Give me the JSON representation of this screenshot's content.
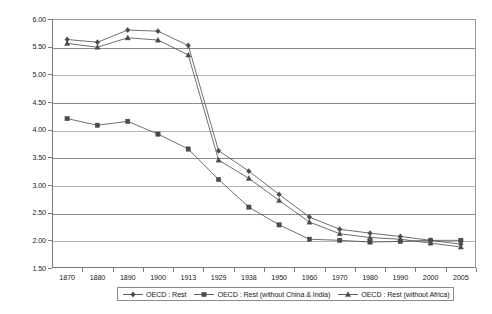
{
  "chart_data": {
    "type": "line",
    "title": "",
    "xlabel": "",
    "ylabel": "",
    "categories": [
      "1870",
      "1880",
      "1890",
      "1900",
      "1913",
      "1929",
      "1938",
      "1950",
      "1960",
      "1970",
      "1980",
      "1990",
      "2000",
      "2005"
    ],
    "ylim": [
      1.5,
      6.0
    ],
    "ytick_step": 0.5,
    "yticks": [
      "1.50",
      "2.00",
      "2.50",
      "3.00",
      "3.50",
      "4.00",
      "4.50",
      "5.00",
      "5.50",
      "6.00"
    ],
    "grid": true,
    "legend_position": "bottom",
    "series": [
      {
        "name": "OECD : Rest",
        "marker": "diamond",
        "color": "#4a4a4a",
        "values": [
          5.63,
          5.58,
          5.8,
          5.78,
          5.52,
          3.62,
          3.25,
          2.83,
          2.42,
          2.2,
          2.13,
          2.07,
          2.0,
          1.93
        ]
      },
      {
        "name": "OECD : Rest (without China & India)",
        "marker": "square",
        "color": "#4a4a4a",
        "values": [
          4.2,
          4.08,
          4.15,
          3.92,
          3.65,
          3.1,
          2.6,
          2.28,
          2.02,
          2.0,
          1.97,
          1.98,
          2.0,
          2.0
        ]
      },
      {
        "name": "OECD : Rest (without Africa)",
        "marker": "triangle",
        "color": "#4a4a4a",
        "values": [
          5.56,
          5.49,
          5.66,
          5.62,
          5.35,
          3.45,
          3.12,
          2.72,
          2.33,
          2.12,
          2.05,
          2.02,
          1.95,
          1.88
        ]
      }
    ]
  },
  "legend": {
    "entries": [
      {
        "label": "OECD : Rest"
      },
      {
        "label": "OECD : Rest (without China & India)"
      },
      {
        "label": "OECD : Rest (without Africa)"
      }
    ]
  }
}
